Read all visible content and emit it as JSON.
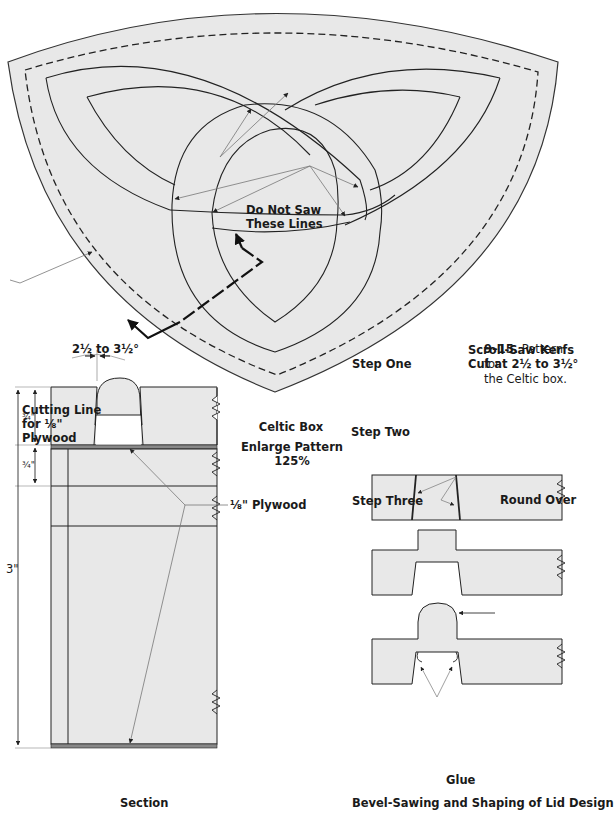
{
  "figure": {
    "number": "9–15.",
    "caption": "Pattern for the Celtic box.",
    "caption_line1": "Pattern for",
    "caption_line2": "the Celtic box."
  },
  "pattern": {
    "do_not_saw_line1": "Do Not Saw",
    "do_not_saw_line2": "These Lines",
    "cutting_line_line1": "Cutting Line",
    "cutting_line_line2": "for ⅛\"",
    "cutting_line_line3": "Plywood"
  },
  "section": {
    "angle_label": "2½ to 3½°",
    "dim_top": "¾\"",
    "dim_mid": "¾\"",
    "dim_total": "3\"",
    "plywood_label": "⅛\" Plywood",
    "title": "Section"
  },
  "center_notes": {
    "box_name": "Celtic Box",
    "enlarge_line1": "Enlarge Pattern",
    "enlarge_line2": "125%"
  },
  "steps": {
    "kerfs_line1": "Scroll-Saw Kerfs",
    "kerfs_line2": "Cut at 2½ to 3½°",
    "step_one": "Step One",
    "step_two": "Step Two",
    "step_three": "Step Three",
    "round_over": "Round Over",
    "glue": "Glue",
    "title": "Bevel-Sawing and Shaping of Lid Design"
  },
  "colors": {
    "fill": "#e8e8e8",
    "stroke": "#222222",
    "leader": "#666666",
    "background": "#ffffff"
  }
}
